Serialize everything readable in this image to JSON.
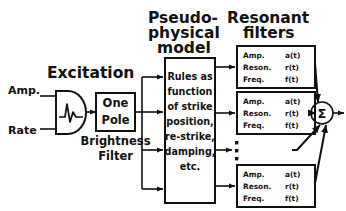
{
  "diagram": {
    "title_sections": {
      "excitation": "Excitation",
      "pseudo_line1": "Pseudo-",
      "pseudo_line2": "physical",
      "pseudo_line3": "model",
      "resonant_line1": "Resonant",
      "resonant_line2": "filters"
    },
    "inputs": [
      {
        "label": "Amp."
      },
      {
        "label": "Rate"
      }
    ],
    "excitation_generator": {
      "icon": "pulse-waveform-icon"
    },
    "one_pole": {
      "line1": "One",
      "line2": "Pole",
      "caption_line1": "Brightness",
      "caption_line2": "Filter"
    },
    "model_box": {
      "lines": [
        "Rules as",
        "function",
        "of strike",
        "position,",
        "re-strike,",
        "damping,",
        "etc."
      ]
    },
    "filters": [
      {
        "rows": [
          {
            "name": "Amp.",
            "value": "a(t)"
          },
          {
            "name": "Reson.",
            "value": "r(t)"
          },
          {
            "name": "Freq.",
            "value": "f(t)"
          }
        ]
      },
      {
        "rows": [
          {
            "name": "Amp.",
            "value": "a(t)"
          },
          {
            "name": "Reson.",
            "value": "r(t)"
          },
          {
            "name": "Freq.",
            "value": "f(t)"
          }
        ]
      },
      {
        "rows": [
          {
            "name": "Amp.",
            "value": "a(t)"
          },
          {
            "name": "Reson.",
            "value": "r(t)"
          },
          {
            "name": "Freq.",
            "value": "f(t)"
          }
        ]
      }
    ],
    "ellipsis": "vertical-ellipsis-icon",
    "summing_node": {
      "symbol": "Σ"
    },
    "colors": {
      "ink": "#111111",
      "background": "#ffffff"
    }
  }
}
